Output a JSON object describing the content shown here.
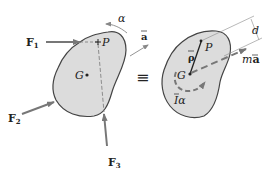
{
  "left_body": {
    "forces": [
      {
        "name": "F",
        "sub": "1"
      },
      {
        "name": "F",
        "sub": "2"
      },
      {
        "name": "F",
        "sub": "3"
      }
    ],
    "point_P": "P",
    "point_G": "G",
    "angular_accel": "α",
    "accel": "a"
  },
  "equiv_symbol": "≡",
  "right_body": {
    "point_P": "P",
    "point_G": "G",
    "rho": "ρ",
    "d": "d",
    "ma_m": "m",
    "ma_a": "a",
    "I_alpha_I": "I",
    "I_alpha_alpha": "α"
  },
  "colors": {
    "body_fill": "#dcdcdc",
    "outline": "#444444",
    "arrow": "#777777",
    "text": "#222222"
  }
}
